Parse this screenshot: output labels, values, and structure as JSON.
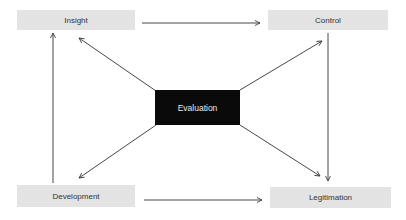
{
  "diagram": {
    "nodes": [
      {
        "id": "insight",
        "label": "Insight",
        "x": 17,
        "y": 10,
        "w": 118,
        "h": 20,
        "style": "light"
      },
      {
        "id": "control",
        "label": "Control",
        "x": 268,
        "y": 10,
        "w": 120,
        "h": 20,
        "style": "light"
      },
      {
        "id": "evaluation",
        "label": "Evaluation",
        "x": 155,
        "y": 90,
        "w": 85,
        "h": 35,
        "style": "dark"
      },
      {
        "id": "development",
        "label": "Development",
        "x": 17,
        "y": 185,
        "w": 118,
        "h": 22,
        "style": "light"
      },
      {
        "id": "legitimation",
        "label": "Legitimation",
        "x": 270,
        "y": 187,
        "w": 121,
        "h": 21,
        "style": "light"
      }
    ],
    "edges": [
      {
        "from": "insight",
        "to": "control"
      },
      {
        "from": "development",
        "to": "insight"
      },
      {
        "from": "control",
        "to": "legitimation"
      },
      {
        "from": "development",
        "to": "legitimation"
      },
      {
        "from": "evaluation",
        "to": "insight"
      },
      {
        "from": "evaluation",
        "to": "control"
      },
      {
        "from": "evaluation",
        "to": "development"
      },
      {
        "from": "evaluation",
        "to": "legitimation"
      }
    ],
    "colors": {
      "node_fill": "#e3e3e3",
      "center_fill": "#0a0a0a",
      "line": "#333333"
    }
  }
}
